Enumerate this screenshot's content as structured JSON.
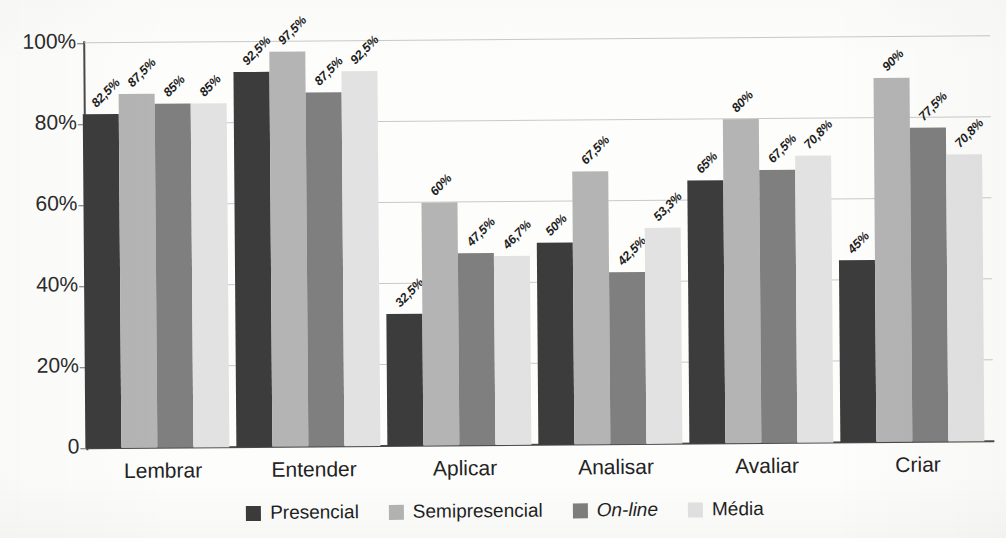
{
  "chart_data": {
    "type": "bar",
    "title": "",
    "subtitle": "",
    "xlabel": "",
    "ylabel": "",
    "ylim": [
      0,
      100
    ],
    "grid": true,
    "legend_position": "bottom",
    "categories": [
      "Lembrar",
      "Entender",
      "Aplicar",
      "Analisar",
      "Avaliar",
      "Criar"
    ],
    "series": [
      {
        "name": "Presencial",
        "color": "#3c3c3c",
        "values": [
          82.5,
          92.5,
          32.5,
          50,
          65,
          45
        ],
        "labels": [
          "82,5%",
          "92,5%",
          "32,5%",
          "50%",
          "65%",
          "45%"
        ]
      },
      {
        "name": "Semipresencial",
        "color": "#b4b4b4",
        "values": [
          87.5,
          97.5,
          60,
          67.5,
          80,
          90
        ],
        "labels": [
          "87,5%",
          "97,5%",
          "60%",
          "67,5%",
          "80%",
          "90%"
        ]
      },
      {
        "name": "On-line",
        "color": "#7f7f7f",
        "italic": true,
        "values": [
          85,
          87.5,
          47.5,
          42.5,
          67.5,
          77.5
        ],
        "labels": [
          "85%",
          "87,5%",
          "47,5%",
          "42,5%",
          "67,5%",
          "77,5%"
        ]
      },
      {
        "name": "Média",
        "color": "#e2e2e2",
        "values": [
          85,
          92.5,
          46.7,
          53.3,
          70.8,
          70.8
        ],
        "labels": [
          "85%",
          "92,5%",
          "46,7%",
          "53,3%",
          "70,8%",
          "70,8%"
        ]
      }
    ],
    "yticks": [
      0,
      20,
      40,
      60,
      80,
      100
    ],
    "ytick_labels": [
      "0",
      "20%",
      "40%",
      "60%",
      "80%",
      "100%"
    ]
  },
  "legend": {
    "items": [
      {
        "label": "Presencial",
        "color": "#3c3c3c"
      },
      {
        "label": "Semipresencial",
        "color": "#b4b4b4"
      },
      {
        "label": "On-line",
        "color": "#7f7f7f"
      },
      {
        "label": "Média",
        "color": "#e2e2e2"
      }
    ]
  }
}
